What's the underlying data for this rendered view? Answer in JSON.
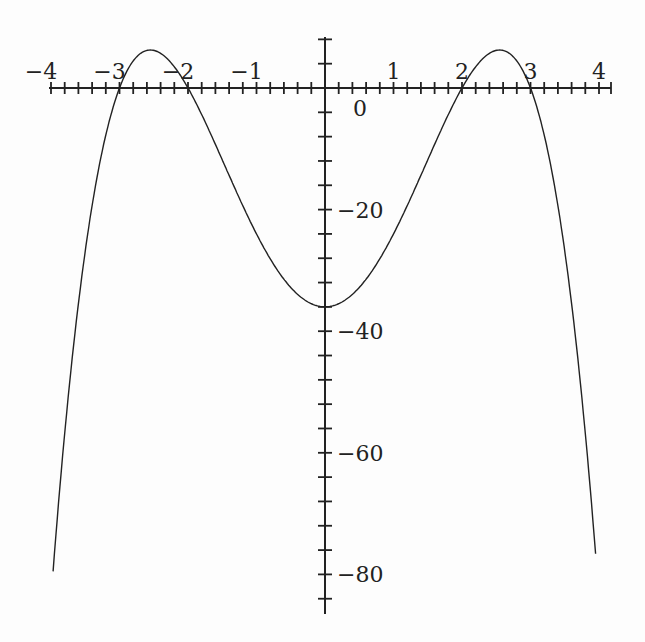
{
  "chart_data": {
    "type": "line",
    "title": "",
    "xlabel": "",
    "ylabel": "",
    "function": "f(x) = -(x^2-4)(x^2-9) = -x^4 + 13x^2 - 36",
    "xlim": [
      -4,
      4
    ],
    "ylim": [
      -86,
      8
    ],
    "x_ticks": [
      -4,
      -3,
      -2,
      -1,
      1,
      2,
      3,
      4
    ],
    "x_tick_labels": [
      "−4",
      "−3",
      "−2",
      "−1",
      "1",
      "2",
      "3",
      "4"
    ],
    "x_minor_step": 0.2,
    "y_ticks": [
      0,
      -20,
      -40,
      -60,
      -80
    ],
    "y_tick_labels": [
      "0",
      "−20",
      "−40",
      "−60",
      "−80"
    ],
    "y_minor_step": 4,
    "grid": false,
    "legend": null,
    "series": [
      {
        "name": "f(x)",
        "x": [
          -3.95,
          -3.5,
          -3,
          -2.75,
          -2.55,
          -2.25,
          -2,
          -1.5,
          -1,
          -0.5,
          0,
          0.5,
          1,
          1.5,
          2,
          2.25,
          2.55,
          2.75,
          3,
          3.5,
          3.95
        ],
        "values": [
          -84.5,
          -26.8,
          0,
          4.6,
          6.2,
          4.8,
          0,
          -12.8,
          -24,
          -32.8,
          -36,
          -32.8,
          -24,
          -12.8,
          0,
          4.8,
          6.2,
          4.6,
          0,
          -26.8,
          -84.5
        ]
      }
    ],
    "color": "#222222"
  },
  "layout": {
    "origin_px": [
      325,
      88
    ],
    "px_per_x_unit": 68.5,
    "px_per_y_unit": 6.08
  }
}
